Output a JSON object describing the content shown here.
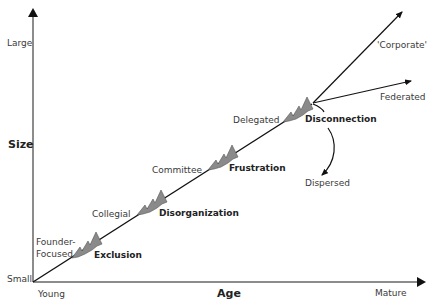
{
  "axes": {
    "y": {
      "title": "Size",
      "top": "Large",
      "bottom": "Small"
    },
    "x": {
      "title": "Age",
      "left": "Young",
      "right": "Mature"
    }
  },
  "stages": [
    {
      "name": "Founder-\nFocused",
      "line1": "Founder-",
      "line2": "Focused",
      "crisis": "Exclusion"
    },
    {
      "name": "Collegial",
      "crisis": "Disorganization"
    },
    {
      "name": "Committee",
      "crisis": "Frustration"
    },
    {
      "name": "Delegated",
      "crisis": "Disconnection"
    }
  ],
  "outcomes": {
    "corporate": "'Corporate'",
    "federated": "Federated",
    "dispersed": "Dispersed"
  },
  "colors": {
    "axis": "#555555",
    "line": "#111111",
    "crisis_fill": "#8a8a8a"
  }
}
